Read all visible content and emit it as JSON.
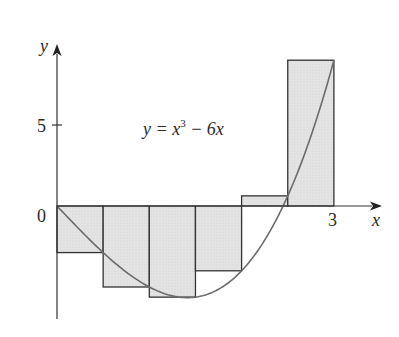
{
  "chart_data": {
    "type": "bar",
    "subtype": "riemann-sum-right-endpoints",
    "title": "",
    "equation": "y = x³ − 6x",
    "equation_parts": {
      "lhs": "y = x",
      "exp": "3",
      "rhs": " − 6x"
    },
    "xlabel": "x",
    "ylabel": "y",
    "x_ticks": [
      {
        "value": 0,
        "label": "0"
      },
      {
        "value": 3,
        "label": "3"
      }
    ],
    "y_ticks": [
      {
        "value": 5,
        "label": "5"
      }
    ],
    "xlim": [
      0,
      3.4
    ],
    "ylim": [
      -7,
      10.5
    ],
    "grid": false,
    "categories": [
      "[0,0.5]",
      "[0.5,1]",
      "[1,1.5]",
      "[1.5,2]",
      "[2,2.5]",
      "[2.5,3]"
    ],
    "intervals": [
      [
        0,
        0.5
      ],
      [
        0.5,
        1
      ],
      [
        1,
        1.5
      ],
      [
        1.5,
        2
      ],
      [
        2,
        2.5
      ],
      [
        2.5,
        3
      ]
    ],
    "values": [
      -2.875,
      -5,
      -5.625,
      -4,
      0.625,
      9
    ],
    "curve": {
      "function": "x^3 - 6x",
      "domain": [
        0,
        3
      ]
    },
    "colors": {
      "bar_fill": "#e2e2e2",
      "bar_stroke": "#333333",
      "curve": "#6b6b6b",
      "axis": "#333333"
    }
  }
}
